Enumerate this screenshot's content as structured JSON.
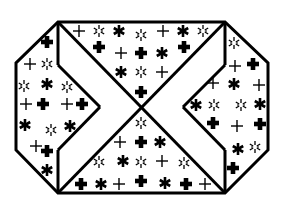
{
  "figure": {
    "width": 284,
    "height": 208,
    "background": "#ffffff",
    "stroke_color": "#000000"
  },
  "geometry": {
    "outer_octagon": [
      [
        58,
        22
      ],
      [
        225,
        22
      ],
      [
        268,
        63
      ],
      [
        268,
        150
      ],
      [
        225,
        193
      ],
      [
        58,
        193
      ],
      [
        16,
        150
      ],
      [
        16,
        63
      ]
    ],
    "lines": [
      [
        [
          58,
          22
        ],
        [
          225,
          193
        ]
      ],
      [
        [
          225,
          22
        ],
        [
          58,
          193
        ]
      ],
      [
        [
          58,
          22
        ],
        [
          58,
          65
        ]
      ],
      [
        [
          58,
          65
        ],
        [
          100,
          107
        ]
      ],
      [
        [
          100,
          107
        ],
        [
          58,
          150
        ]
      ],
      [
        [
          58,
          150
        ],
        [
          58,
          193
        ]
      ],
      [
        [
          225,
          22
        ],
        [
          225,
          65
        ]
      ],
      [
        [
          225,
          65
        ],
        [
          183,
          107
        ]
      ],
      [
        [
          183,
          107
        ],
        [
          225,
          150
        ]
      ],
      [
        [
          225,
          150
        ],
        [
          225,
          193
        ]
      ]
    ]
  },
  "symbol_legend": {
    "thin": "thin-cross-icon",
    "bold": "bold-cross-icon",
    "asterisk": "bold-asterisk-icon",
    "star": "outline-star-icon"
  },
  "regions": {
    "top": [
      {
        "t": "thin",
        "x": 79,
        "y": 31
      },
      {
        "t": "star",
        "x": 99,
        "y": 31
      },
      {
        "t": "asterisk",
        "x": 119,
        "y": 31
      },
      {
        "t": "star",
        "x": 141,
        "y": 35
      },
      {
        "t": "thin",
        "x": 163,
        "y": 31
      },
      {
        "t": "asterisk",
        "x": 183,
        "y": 31
      },
      {
        "t": "star",
        "x": 203,
        "y": 31
      },
      {
        "t": "bold",
        "x": 99,
        "y": 47
      },
      {
        "t": "thin",
        "x": 121,
        "y": 53
      },
      {
        "t": "bold",
        "x": 141,
        "y": 53
      },
      {
        "t": "asterisk",
        "x": 162,
        "y": 53
      },
      {
        "t": "bold",
        "x": 184,
        "y": 47
      },
      {
        "t": "asterisk",
        "x": 121,
        "y": 72
      },
      {
        "t": "star",
        "x": 141,
        "y": 72
      },
      {
        "t": "thin",
        "x": 162,
        "y": 72
      },
      {
        "t": "bold",
        "x": 141,
        "y": 92
      }
    ],
    "bottom": [
      {
        "t": "star",
        "x": 141,
        "y": 123
      },
      {
        "t": "thin",
        "x": 120,
        "y": 142
      },
      {
        "t": "bold",
        "x": 141,
        "y": 142
      },
      {
        "t": "asterisk",
        "x": 160,
        "y": 142
      },
      {
        "t": "star",
        "x": 99,
        "y": 162
      },
      {
        "t": "asterisk",
        "x": 123,
        "y": 161
      },
      {
        "t": "star",
        "x": 141,
        "y": 162
      },
      {
        "t": "thin",
        "x": 162,
        "y": 161
      },
      {
        "t": "star",
        "x": 184,
        "y": 163
      },
      {
        "t": "bold",
        "x": 81,
        "y": 184
      },
      {
        "t": "asterisk",
        "x": 101,
        "y": 184
      },
      {
        "t": "thin",
        "x": 119,
        "y": 184
      },
      {
        "t": "bold",
        "x": 141,
        "y": 181
      },
      {
        "t": "asterisk",
        "x": 165,
        "y": 183
      },
      {
        "t": "bold",
        "x": 186,
        "y": 184
      },
      {
        "t": "thin",
        "x": 205,
        "y": 184
      }
    ],
    "left": [
      {
        "t": "bold",
        "x": 47,
        "y": 42
      },
      {
        "t": "thin",
        "x": 30,
        "y": 64
      },
      {
        "t": "star",
        "x": 47,
        "y": 64
      },
      {
        "t": "star",
        "x": 24,
        "y": 86
      },
      {
        "t": "asterisk",
        "x": 47,
        "y": 84
      },
      {
        "t": "star",
        "x": 67,
        "y": 87
      },
      {
        "t": "thin",
        "x": 26,
        "y": 104
      },
      {
        "t": "bold",
        "x": 43,
        "y": 104
      },
      {
        "t": "thin",
        "x": 67,
        "y": 104
      },
      {
        "t": "bold",
        "x": 82,
        "y": 104
      },
      {
        "t": "asterisk",
        "x": 25,
        "y": 125
      },
      {
        "t": "star",
        "x": 51,
        "y": 130
      },
      {
        "t": "asterisk",
        "x": 70,
        "y": 126
      },
      {
        "t": "thin",
        "x": 36,
        "y": 146
      },
      {
        "t": "bold",
        "x": 47,
        "y": 151
      },
      {
        "t": "asterisk",
        "x": 47,
        "y": 170
      }
    ],
    "right": [
      {
        "t": "star",
        "x": 234,
        "y": 43
      },
      {
        "t": "thin",
        "x": 235,
        "y": 66
      },
      {
        "t": "bold",
        "x": 253,
        "y": 64
      },
      {
        "t": "thin",
        "x": 213,
        "y": 83
      },
      {
        "t": "asterisk",
        "x": 234,
        "y": 84
      },
      {
        "t": "thin",
        "x": 259,
        "y": 85
      },
      {
        "t": "asterisk",
        "x": 196,
        "y": 105
      },
      {
        "t": "star",
        "x": 214,
        "y": 105
      },
      {
        "t": "star",
        "x": 241,
        "y": 105
      },
      {
        "t": "asterisk",
        "x": 260,
        "y": 104
      },
      {
        "t": "bold",
        "x": 213,
        "y": 123
      },
      {
        "t": "thin",
        "x": 237,
        "y": 126
      },
      {
        "t": "bold",
        "x": 260,
        "y": 124
      },
      {
        "t": "asterisk",
        "x": 238,
        "y": 149
      },
      {
        "t": "star",
        "x": 255,
        "y": 147
      },
      {
        "t": "bold",
        "x": 233,
        "y": 168
      }
    ]
  }
}
